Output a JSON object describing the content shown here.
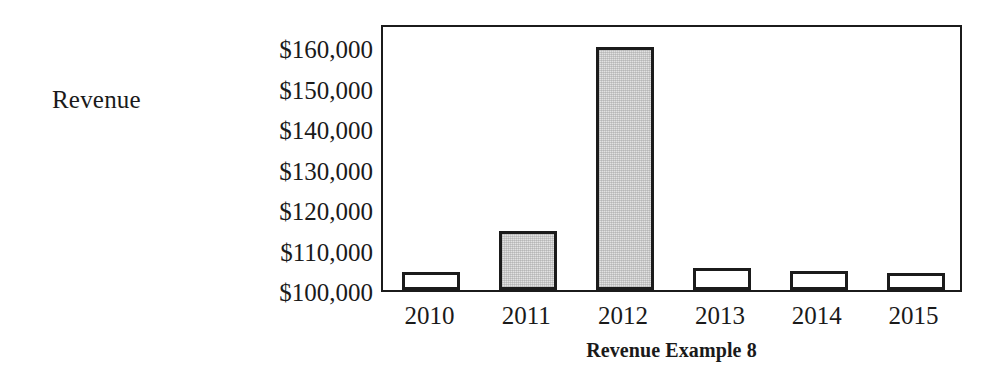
{
  "chart_data": {
    "type": "bar",
    "title": "Revenue Example 8",
    "xlabel": "",
    "ylabel": "Revenue",
    "categories": [
      "2010",
      "2011",
      "2012",
      "2013",
      "2014",
      "2015"
    ],
    "values": [
      104500,
      114500,
      160000,
      105500,
      104800,
      104300
    ],
    "ytick_labels": [
      "$160,000",
      "$150,000",
      "$140,000",
      "$130,000",
      "$120,000",
      "$110,000",
      "$100,000"
    ],
    "ytick_values": [
      160000,
      150000,
      140000,
      130000,
      120000,
      110000,
      100000
    ],
    "ylim": [
      100000,
      166000
    ],
    "baseline": 100000,
    "grid": false,
    "legend": false,
    "series": [
      {
        "name": "Revenue",
        "values": [
          104500,
          114500,
          160000,
          105500,
          104800,
          104300
        ],
        "bar_fills": [
          "white",
          "gray",
          "gray",
          "white",
          "white",
          "white"
        ]
      }
    ],
    "colors": {
      "bar_fill_gray": "#e2e2e2",
      "bar_fill_white": "#ffffff",
      "bar_outline": "#1b1b1b",
      "frame": "#1b1b1b",
      "text": "#1a1a1a",
      "background": "#ffffff"
    }
  }
}
